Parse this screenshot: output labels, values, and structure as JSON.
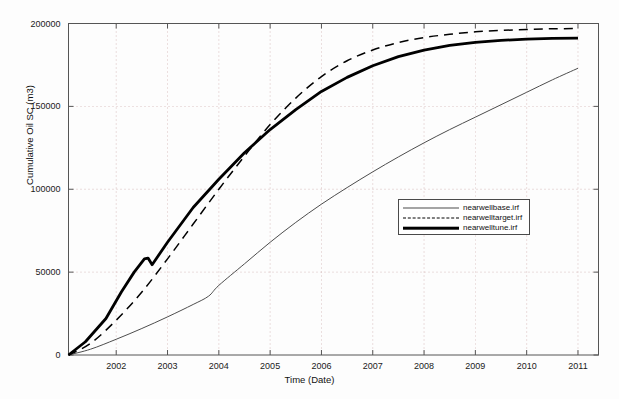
{
  "chart_data": {
    "type": "line",
    "title": "",
    "xlabel": "Time (Date)",
    "ylabel": "Cumulative Oil SC (m3)",
    "xlim": [
      2001.07,
      2011.4
    ],
    "ylim": [
      0,
      200000
    ],
    "xticks": [
      2002,
      2003,
      2004,
      2005,
      2006,
      2007,
      2008,
      2009,
      2010,
      2011
    ],
    "xtick_labels": [
      "2002",
      "2003",
      "2004",
      "2005",
      "2006",
      "2007",
      "2008",
      "2009",
      "2010",
      "2011"
    ],
    "yticks": [
      0,
      50000,
      100000,
      150000,
      200000
    ],
    "ytick_labels": [
      "0",
      "50000",
      "100000",
      "150000",
      "200000"
    ],
    "grid": true,
    "grid_style": "dotted",
    "legend_position": "center-right",
    "series": [
      {
        "name": "nearwellbase.irf",
        "style": "solid-thin",
        "color": "#4d4d4d",
        "x": [
          2001.07,
          2001.5,
          2002,
          2002.5,
          2003,
          2003.5,
          2003.8,
          2004,
          2004.5,
          2005,
          2005.5,
          2006,
          2006.5,
          2007,
          2007.5,
          2008,
          2008.5,
          2009,
          2009.5,
          2010,
          2010.5,
          2011
        ],
        "y": [
          0,
          3500,
          9500,
          16000,
          23000,
          30500,
          35500,
          42000,
          55000,
          68000,
          80000,
          91000,
          101000,
          110500,
          119500,
          128000,
          136000,
          143500,
          151000,
          158500,
          166000,
          173000
        ]
      },
      {
        "name": "nearwelltarget.irf",
        "style": "dashed",
        "color": "#000000",
        "x": [
          2001.07,
          2001.5,
          2002,
          2002.5,
          2003,
          2003.5,
          2004,
          2004.5,
          2005,
          2005.5,
          2006,
          2006.5,
          2007,
          2007.5,
          2008,
          2008.5,
          2009,
          2009.5,
          2010,
          2010.5,
          2011
        ],
        "y": [
          0,
          7000,
          21000,
          38000,
          58000,
          79000,
          100000,
          120000,
          139000,
          155000,
          168000,
          177500,
          184000,
          188500,
          191500,
          193500,
          195000,
          195800,
          196400,
          196800,
          197000
        ]
      },
      {
        "name": "nearwelltune.irf",
        "style": "solid-thick",
        "color": "#000000",
        "x": [
          2001.07,
          2001.4,
          2001.8,
          2002.1,
          2002.35,
          2002.55,
          2002.62,
          2002.7,
          2003,
          2003.5,
          2004,
          2004.5,
          2005,
          2005.5,
          2006,
          2006.5,
          2007,
          2007.5,
          2008,
          2008.5,
          2009,
          2009.5,
          2010,
          2010.5,
          2011
        ],
        "y": [
          0,
          8000,
          22000,
          38000,
          50000,
          58000,
          58500,
          54500,
          68000,
          89000,
          106000,
          122000,
          136000,
          148000,
          159000,
          167500,
          174500,
          180000,
          184000,
          186800,
          188600,
          189800,
          190600,
          191000,
          191200
        ]
      }
    ]
  },
  "axes": {
    "x_tick_labels": [
      "2002",
      "2003",
      "2004",
      "2005",
      "2006",
      "2007",
      "2008",
      "2009",
      "2010",
      "2011"
    ],
    "y_tick_labels": [
      "0",
      "50000",
      "100000",
      "150000",
      "200000"
    ],
    "x_axis_title": "Time (Date)",
    "y_axis_title": "Cumulative Oil SC (m3)"
  },
  "legend": {
    "entries": [
      {
        "label": "nearwellbase.irf",
        "sample": "thin-solid-line"
      },
      {
        "label": "nearwelltarget.irf",
        "sample": "dashed-line"
      },
      {
        "label": "nearwelltune.irf",
        "sample": "thick-solid-line"
      }
    ]
  },
  "colors": {
    "series_thin": "#4d4d4d",
    "series_dashed": "#000000",
    "series_thick": "#000000",
    "axis": "#555555",
    "grid": "#bb8888",
    "background": "#fdfdfd"
  }
}
